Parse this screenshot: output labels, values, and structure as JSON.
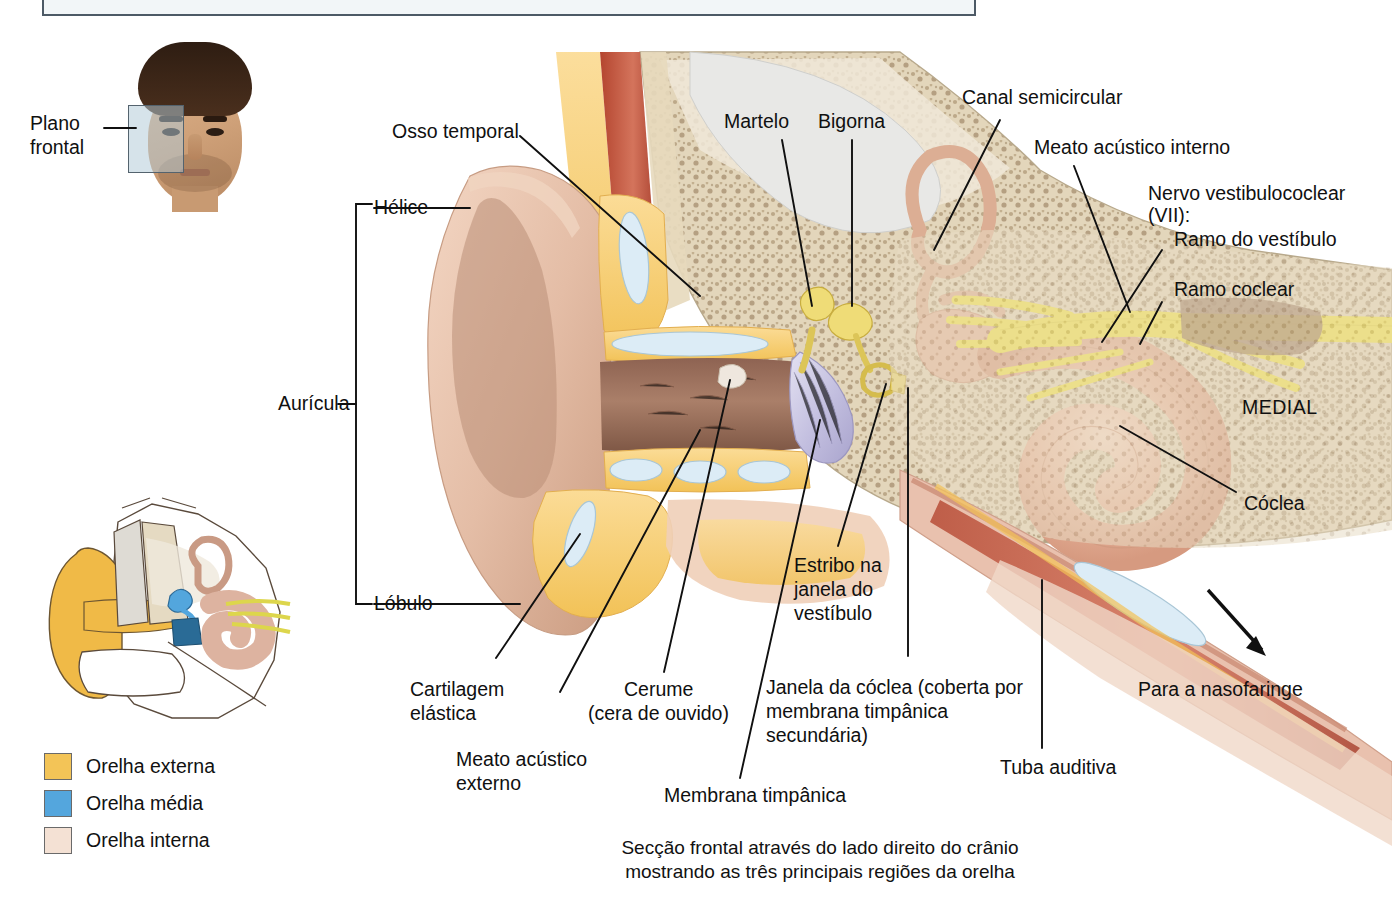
{
  "title_box": {
    "text": "interna."
  },
  "figure": {
    "caption_line1": "Secção frontal através do lado direito do crânio",
    "caption_line2": "mostrando as três principais regiões da orelha",
    "orientation_label": "MEDIAL"
  },
  "plane_callout": {
    "line1": "Plano",
    "line2": "frontal"
  },
  "bracket_labels": {
    "helix": "Hélice",
    "auricle": "Aurícula",
    "lobule": "Lóbulo"
  },
  "labels": [
    {
      "id": "osso-temporal",
      "text": "Osso temporal"
    },
    {
      "id": "martelo",
      "text": "Martelo"
    },
    {
      "id": "bigorna",
      "text": "Bigorna"
    },
    {
      "id": "canal-semicircular",
      "text": "Canal semicircular"
    },
    {
      "id": "meato-interno",
      "text": "Meato acústico interno"
    },
    {
      "id": "nervo-l1",
      "text": "Nervo vestibulococlear"
    },
    {
      "id": "nervo-l2",
      "text": "(VII):"
    },
    {
      "id": "ramo-vestibulo",
      "text": "Ramo do vestíbulo"
    },
    {
      "id": "ramo-coclear",
      "text": "Ramo coclear"
    },
    {
      "id": "coclea",
      "text": "Cóclea"
    },
    {
      "id": "estribo-l1",
      "text": "Estribo na"
    },
    {
      "id": "estribo-l2",
      "text": "janela do"
    },
    {
      "id": "estribo-l3",
      "text": "vestíbulo"
    },
    {
      "id": "cartilagem-l1",
      "text": "Cartilagem"
    },
    {
      "id": "cartilagem-l2",
      "text": "elástica"
    },
    {
      "id": "meato-externo-l1",
      "text": "Meato acústico"
    },
    {
      "id": "meato-externo-l2",
      "text": "externo"
    },
    {
      "id": "cerume-l1",
      "text": "Cerume"
    },
    {
      "id": "cerume-l2",
      "text": "(cera de ouvido)"
    },
    {
      "id": "janela-coclea-l1",
      "text": "Janela da cóclea (coberta por"
    },
    {
      "id": "janela-coclea-l2",
      "text": "membrana timpânica"
    },
    {
      "id": "janela-coclea-l3",
      "text": "secundária)"
    },
    {
      "id": "membrana-timpanica",
      "text": "Membrana timpânica"
    },
    {
      "id": "tuba-auditiva",
      "text": "Tuba auditiva"
    },
    {
      "id": "para-nasofaringe",
      "text": "Para a nasofaringe"
    }
  ],
  "legend": {
    "items": [
      {
        "label": "Orelha externa",
        "color": "#f3c457"
      },
      {
        "label": "Orelha média",
        "color": "#54a6dd"
      },
      {
        "label": "Orelha interna",
        "color": "#f4e1d4"
      }
    ]
  },
  "palette": {
    "skin": "#e6bfa6",
    "cartilage": "#cfe6f2",
    "fat": "#f6cd72",
    "bone": "#ded0b6",
    "ossicle": "#f0dc74",
    "eardrum": "#c6c3e2",
    "nerve": "#f2e142",
    "muscle": "#c0553f",
    "cochlea": "#e9b9a3",
    "line": "#101010"
  }
}
